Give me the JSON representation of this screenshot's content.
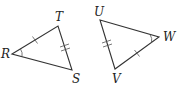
{
  "figure": {
    "triangles": [
      {
        "name": "RTS",
        "vertices": {
          "R": {
            "label": "R",
            "x": 12,
            "y": 54,
            "label_x": 1,
            "label_y": 58
          },
          "T": {
            "label": "T",
            "x": 58,
            "y": 26,
            "label_x": 55,
            "label_y": 21
          },
          "S": {
            "label": "S",
            "x": 72,
            "y": 70,
            "label_x": 72,
            "label_y": 83
          }
        },
        "markings": {
          "single_tick_side": "RT",
          "double_tick_side": "TS",
          "angle_arc_vertex": "R"
        }
      },
      {
        "name": "UVW",
        "vertices": {
          "U": {
            "label": "U",
            "x": 100,
            "y": 20,
            "label_x": 94,
            "label_y": 16
          },
          "V": {
            "label": "V",
            "x": 115,
            "y": 69,
            "label_x": 112,
            "label_y": 83
          },
          "W": {
            "label": "W",
            "x": 159,
            "y": 37,
            "label_x": 163,
            "label_y": 41
          }
        },
        "markings": {
          "double_tick_side": "UV",
          "single_tick_side": "VW",
          "angle_arc_vertex": "W"
        }
      }
    ]
  }
}
